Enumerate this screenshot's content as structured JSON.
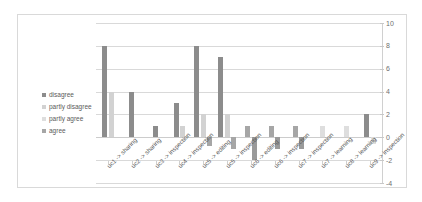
{
  "chart_data": {
    "type": "bar",
    "title": "",
    "xlabel": "",
    "ylabel": "",
    "ylim": [
      -4,
      10
    ],
    "yticks": [
      10,
      8,
      6,
      4,
      2,
      0,
      -2,
      -4
    ],
    "grid": true,
    "legend_position": "left",
    "categories": [
      "uc1 -> sharing",
      "uc2 -> sharing",
      "uc3 -> inspection",
      "uc4 -> inspection",
      "uc5 -> editing",
      "uc5 -> inspection",
      "uc6 -> editing",
      "uc6 -> inspection",
      "uc7 -> inspection",
      "uc7 -> learning",
      "uc8 -> learning",
      "uc9 -> inspection"
    ],
    "series": [
      {
        "name": "disagree",
        "color": "#8c8c8c",
        "values": [
          8,
          4,
          1,
          3,
          8,
          7,
          0,
          0,
          0,
          0,
          0,
          2
        ]
      },
      {
        "name": "partly disagree",
        "color": "#d2d2d2",
        "values": [
          4,
          0,
          0,
          1,
          2,
          2,
          0,
          0,
          0,
          0,
          0,
          0
        ]
      },
      {
        "name": "partly agree",
        "color": "#dedede",
        "values": [
          0,
          0,
          0,
          0,
          0,
          0,
          0,
          0,
          0,
          1,
          1,
          -0.6
        ]
      },
      {
        "name": "agree",
        "color": "#a6a6a6",
        "values": [
          0,
          0,
          0,
          0,
          -0.8,
          -1,
          1,
          1,
          1,
          0,
          0,
          0
        ]
      },
      {
        "name": "negative",
        "color": "#9a9a9a",
        "values": [
          0,
          0,
          0,
          0,
          0,
          0,
          -2,
          -1,
          -1,
          0,
          0,
          0
        ]
      }
    ]
  },
  "legend": {
    "items": [
      {
        "label": "disagree",
        "color": "#8c8c8c"
      },
      {
        "label": "partly disagree",
        "color": "#d2d2d2"
      },
      {
        "label": "partly agree",
        "color": "#dedede"
      },
      {
        "label": "agree",
        "color": "#a6a6a6"
      }
    ]
  }
}
